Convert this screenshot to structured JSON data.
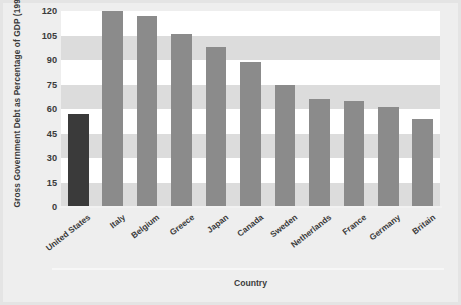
{
  "chart_data": {
    "type": "bar",
    "title": "",
    "subtitle": "",
    "xlabel": "Country",
    "ylabel": "Gross Government Debt as Percentage of GDP (1998)",
    "categories": [
      "United States",
      "Italy",
      "Belgium",
      "Greece",
      "Japan",
      "Canada",
      "Sweden",
      "Netherlands",
      "France",
      "Germany",
      "Britain"
    ],
    "values": [
      57,
      120,
      117,
      106,
      98,
      89,
      75,
      66,
      65,
      61,
      54
    ],
    "series": [
      {
        "name": "Gross Government Debt as Percentage of GDP (1998)",
        "values": [
          57,
          120,
          117,
          106,
          98,
          89,
          75,
          66,
          65,
          61,
          54
        ]
      }
    ],
    "ylim": [
      0,
      120
    ],
    "ytick_values": [
      0,
      15,
      30,
      45,
      60,
      75,
      90,
      105,
      120
    ],
    "ytick_labels": [
      "0",
      "15",
      "30",
      "45",
      "60",
      "75",
      "90",
      "105",
      "120"
    ],
    "grid": "horizontal-alternating-bands",
    "legend": "none",
    "highlight_category": "United States",
    "colors": {
      "bar": "#8b8b8b",
      "bar_highlight": "#3a3a3a",
      "plot_background": "#ffffff",
      "band": "#dcdcdc",
      "figure_background": "#eeeeee",
      "text": "#3b3b3b"
    }
  }
}
